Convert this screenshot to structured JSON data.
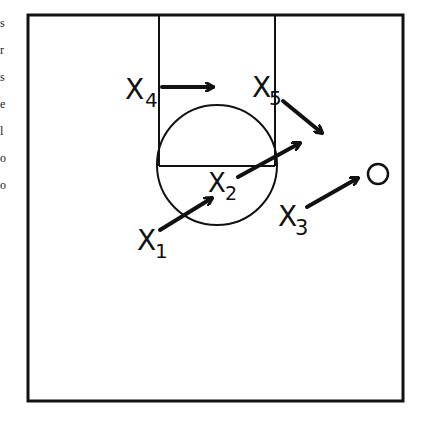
{
  "diagram": {
    "type": "basketball-play-diagram",
    "court": {
      "x": 28,
      "y": 15,
      "width": 375,
      "height": 386
    },
    "lane": {
      "left_x": 159,
      "right_x": 275,
      "top_y": 15,
      "free_throw_y": 166
    },
    "center_circle": {
      "cx": 217,
      "cy": 165,
      "r": 60
    },
    "players": [
      {
        "id": "x1",
        "label": "X",
        "sub": "1",
        "x": 137,
        "y": 250
      },
      {
        "id": "x2",
        "label": "X",
        "sub": "2",
        "x": 208,
        "y": 192
      },
      {
        "id": "x3",
        "label": "X",
        "sub": "3",
        "x": 278,
        "y": 226
      },
      {
        "id": "x4",
        "label": "X",
        "sub": "4",
        "x": 125,
        "y": 99
      },
      {
        "id": "x5",
        "label": "X",
        "sub": "5",
        "x": 252,
        "y": 97
      }
    ],
    "offense_marker": {
      "label": "O",
      "cx": 378,
      "cy": 174,
      "r": 10
    },
    "arrows": [
      {
        "from": "x1",
        "x1": 160,
        "y1": 230,
        "x2": 212,
        "y2": 198
      },
      {
        "from": "x2",
        "x1": 238,
        "y1": 177,
        "x2": 300,
        "y2": 143
      },
      {
        "from": "x3",
        "x1": 307,
        "y1": 207,
        "x2": 358,
        "y2": 178
      },
      {
        "from": "x4",
        "x1": 162,
        "y1": 87,
        "x2": 213,
        "y2": 87
      },
      {
        "from": "x5",
        "x1": 283,
        "y1": 101,
        "x2": 322,
        "y2": 133
      }
    ],
    "colors": {
      "ink": "#111111",
      "paper": "#ffffff"
    }
  },
  "edge_fragments": [
    "s",
    "r",
    "s",
    "e",
    "l",
    "o",
    "o"
  ],
  "text": {
    "x1": "X",
    "x1_sub": "1",
    "x2": "X",
    "x2_sub": "2",
    "x3": "X",
    "x3_sub": "3",
    "x4": "X",
    "x4_sub": "4",
    "x5": "X",
    "x5_sub": "5"
  }
}
